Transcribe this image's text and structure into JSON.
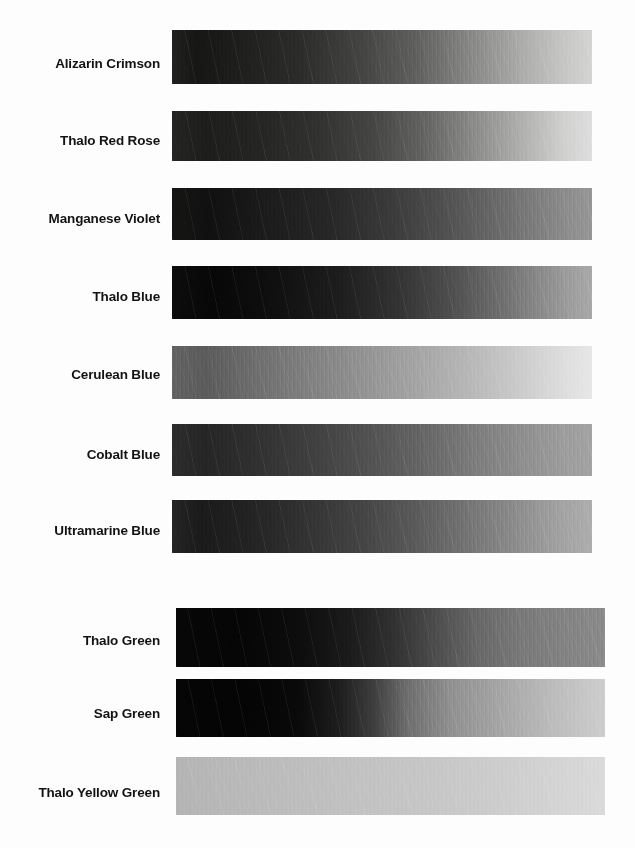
{
  "document": {
    "title": "Pigment Value Scale Chart",
    "description": "Grayscale value-scale swatch chart: ten oil paint pigments brushed out from masstone (full strength, left) to tint (lightest, right), reproduced in black and white.",
    "background_color": "#ffffff",
    "label_color": "#131313"
  },
  "chart_data": {
    "type": "heatmap",
    "xlabel": "",
    "ylabel": "",
    "grid": false,
    "legend": "none",
    "orientation": "horizontal-gradient-bands",
    "value_axis": "left = masstone (darkest), right = tint (lightest)",
    "value_scale_note": "Values read as 8-bit grayscale levels, 0 = black, 255 = white",
    "categories": [
      "Alizarin Crimson",
      "Thalo Red Rose",
      "Manganese Violet",
      "Thalo Blue",
      "Cerulean Blue",
      "Cobalt Blue",
      "Ultramarine Blue",
      "Thalo Green",
      "Sap Green",
      "Thalo Yellow Green"
    ],
    "series": [
      {
        "name": "masstone value (left end)",
        "values": [
          22,
          28,
          20,
          10,
          95,
          42,
          30,
          6,
          5,
          180
        ]
      },
      {
        "name": "midpoint value",
        "values": [
          72,
          70,
          58,
          56,
          150,
          108,
          95,
          62,
          70,
          192
        ]
      },
      {
        "name": "tint value (right end)",
        "values": [
          205,
          215,
          150,
          168,
          235,
          160,
          175,
          140,
          205,
          225
        ]
      }
    ]
  },
  "rows": [
    {
      "label": "Alizarin Crimson",
      "label_top": 57,
      "band": {
        "left": 172,
        "top": 30,
        "width": 420,
        "height": 54
      },
      "gradient": {
        "stops": [
          {
            "pos": 0,
            "color": "#20201f"
          },
          {
            "pos": 6,
            "color": "#161615"
          },
          {
            "pos": 14,
            "color": "#1c1c1b"
          },
          {
            "pos": 30,
            "color": "#2b2b2a"
          },
          {
            "pos": 45,
            "color": "#434342"
          },
          {
            "pos": 58,
            "color": "#5f5f5e"
          },
          {
            "pos": 70,
            "color": "#848483"
          },
          {
            "pos": 82,
            "color": "#a8a8a7"
          },
          {
            "pos": 92,
            "color": "#c3c3c2"
          },
          {
            "pos": 100,
            "color": "#d4d4d3"
          }
        ]
      }
    },
    {
      "label": "Thalo Red Rose",
      "label_top": 134,
      "band": {
        "left": 172,
        "top": 111,
        "width": 420,
        "height": 50
      },
      "gradient": {
        "stops": [
          {
            "pos": 0,
            "color": "#242423"
          },
          {
            "pos": 8,
            "color": "#1d1d1c"
          },
          {
            "pos": 20,
            "color": "#242423"
          },
          {
            "pos": 34,
            "color": "#30302f"
          },
          {
            "pos": 48,
            "color": "#454544"
          },
          {
            "pos": 60,
            "color": "#636362"
          },
          {
            "pos": 72,
            "color": "#8b8b8a"
          },
          {
            "pos": 84,
            "color": "#b2b2b1"
          },
          {
            "pos": 93,
            "color": "#cfcfce"
          },
          {
            "pos": 100,
            "color": "#dedede"
          }
        ]
      }
    },
    {
      "label": "Manganese Violet",
      "label_top": 212,
      "band": {
        "left": 172,
        "top": 188,
        "width": 420,
        "height": 52
      },
      "gradient": {
        "stops": [
          {
            "pos": 0,
            "color": "#151514"
          },
          {
            "pos": 9,
            "color": "#101010"
          },
          {
            "pos": 22,
            "color": "#1b1b1b"
          },
          {
            "pos": 38,
            "color": "#272727"
          },
          {
            "pos": 52,
            "color": "#3a3a3a"
          },
          {
            "pos": 64,
            "color": "#4e4e4e"
          },
          {
            "pos": 76,
            "color": "#666666"
          },
          {
            "pos": 87,
            "color": "#7e7e7e"
          },
          {
            "pos": 95,
            "color": "#8e8e8e"
          },
          {
            "pos": 100,
            "color": "#969696"
          }
        ]
      }
    },
    {
      "label": "Thalo Blue",
      "label_top": 290,
      "band": {
        "left": 172,
        "top": 266,
        "width": 420,
        "height": 53
      },
      "gradient": {
        "stops": [
          {
            "pos": 0,
            "color": "#0c0c0c"
          },
          {
            "pos": 10,
            "color": "#070707"
          },
          {
            "pos": 24,
            "color": "#0f0f0f"
          },
          {
            "pos": 40,
            "color": "#1d1d1d"
          },
          {
            "pos": 54,
            "color": "#333333"
          },
          {
            "pos": 66,
            "color": "#4d4d4d"
          },
          {
            "pos": 78,
            "color": "#6d6d6d"
          },
          {
            "pos": 88,
            "color": "#8b8b8b"
          },
          {
            "pos": 96,
            "color": "#a0a0a0"
          },
          {
            "pos": 100,
            "color": "#a8a8a8"
          }
        ]
      }
    },
    {
      "label": "Cerulean Blue",
      "label_top": 368,
      "band": {
        "left": 172,
        "top": 346,
        "width": 420,
        "height": 53
      },
      "gradient": {
        "stops": [
          {
            "pos": 0,
            "color": "#626262"
          },
          {
            "pos": 8,
            "color": "#5b5b5b"
          },
          {
            "pos": 20,
            "color": "#6e6e6e"
          },
          {
            "pos": 34,
            "color": "#828282"
          },
          {
            "pos": 48,
            "color": "#969696"
          },
          {
            "pos": 60,
            "color": "#a7a7a7"
          },
          {
            "pos": 72,
            "color": "#b9b9b9"
          },
          {
            "pos": 84,
            "color": "#cdcdcd"
          },
          {
            "pos": 93,
            "color": "#dddddd"
          },
          {
            "pos": 100,
            "color": "#e7e7e7"
          }
        ]
      }
    },
    {
      "label": "Cobalt Blue",
      "label_top": 448,
      "band": {
        "left": 172,
        "top": 424,
        "width": 420,
        "height": 52
      },
      "gradient": {
        "stops": [
          {
            "pos": 0,
            "color": "#2c2c2c"
          },
          {
            "pos": 8,
            "color": "#252525"
          },
          {
            "pos": 20,
            "color": "#303030"
          },
          {
            "pos": 34,
            "color": "#404040"
          },
          {
            "pos": 48,
            "color": "#535353"
          },
          {
            "pos": 60,
            "color": "#666666"
          },
          {
            "pos": 72,
            "color": "#7c7c7c"
          },
          {
            "pos": 84,
            "color": "#8f8f8f"
          },
          {
            "pos": 93,
            "color": "#9c9c9c"
          },
          {
            "pos": 100,
            "color": "#a3a3a3"
          }
        ]
      }
    },
    {
      "label": "Ultramarine Blue",
      "label_top": 524,
      "band": {
        "left": 172,
        "top": 500,
        "width": 420,
        "height": 53
      },
      "gradient": {
        "stops": [
          {
            "pos": 0,
            "color": "#242424"
          },
          {
            "pos": 7,
            "color": "#1a1a1a"
          },
          {
            "pos": 18,
            "color": "#222222"
          },
          {
            "pos": 32,
            "color": "#323232"
          },
          {
            "pos": 46,
            "color": "#454545"
          },
          {
            "pos": 58,
            "color": "#5a5a5a"
          },
          {
            "pos": 70,
            "color": "#737373"
          },
          {
            "pos": 82,
            "color": "#8c8c8c"
          },
          {
            "pos": 92,
            "color": "#a1a1a1"
          },
          {
            "pos": 100,
            "color": "#adadad"
          }
        ]
      }
    },
    {
      "label": "Thalo Green",
      "label_top": 634,
      "band": {
        "left": 176,
        "top": 608,
        "width": 429,
        "height": 59
      },
      "gradient": {
        "stops": [
          {
            "pos": 0,
            "color": "#070707"
          },
          {
            "pos": 14,
            "color": "#050505"
          },
          {
            "pos": 28,
            "color": "#0c0c0c"
          },
          {
            "pos": 40,
            "color": "#1a1a1a"
          },
          {
            "pos": 50,
            "color": "#2f2f2f"
          },
          {
            "pos": 60,
            "color": "#4b4b4b"
          },
          {
            "pos": 70,
            "color": "#676767"
          },
          {
            "pos": 80,
            "color": "#787878"
          },
          {
            "pos": 90,
            "color": "#828282"
          },
          {
            "pos": 100,
            "color": "#8a8a8a"
          }
        ]
      }
    },
    {
      "label": "Sap Green",
      "label_top": 707,
      "band": {
        "left": 176,
        "top": 679,
        "width": 429,
        "height": 58
      },
      "gradient": {
        "stops": [
          {
            "pos": 0,
            "color": "#050505"
          },
          {
            "pos": 16,
            "color": "#040404"
          },
          {
            "pos": 28,
            "color": "#090909"
          },
          {
            "pos": 38,
            "color": "#1d1d1d"
          },
          {
            "pos": 46,
            "color": "#3d3d3d"
          },
          {
            "pos": 54,
            "color": "#6e6e6e"
          },
          {
            "pos": 64,
            "color": "#909090"
          },
          {
            "pos": 76,
            "color": "#a6a6a6"
          },
          {
            "pos": 88,
            "color": "#bcbcbc"
          },
          {
            "pos": 100,
            "color": "#cdcdcd"
          }
        ]
      }
    },
    {
      "label": "Thalo Yellow Green",
      "label_top": 786,
      "band": {
        "left": 176,
        "top": 757,
        "width": 429,
        "height": 58
      },
      "gradient": {
        "stops": [
          {
            "pos": 0,
            "color": "#b4b4b4"
          },
          {
            "pos": 12,
            "color": "#b8b8b8"
          },
          {
            "pos": 28,
            "color": "#bdbdbd"
          },
          {
            "pos": 44,
            "color": "#c2c2c2"
          },
          {
            "pos": 58,
            "color": "#c6c6c6"
          },
          {
            "pos": 72,
            "color": "#cbcbcb"
          },
          {
            "pos": 86,
            "color": "#d2d2d2"
          },
          {
            "pos": 100,
            "color": "#dadada"
          }
        ]
      }
    }
  ]
}
